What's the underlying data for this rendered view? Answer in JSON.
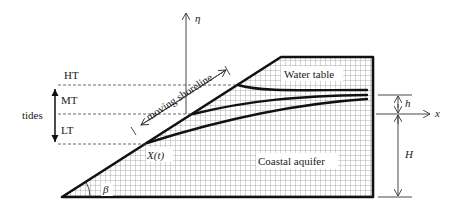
{
  "diagram": {
    "labels": {
      "eta_axis": "η",
      "x_axis": "x",
      "high_tide": "HT",
      "mean_tide": "MT",
      "low_tide": "LT",
      "tides": "tides",
      "moving_shoreline": "moving shoreline",
      "water_table": "Water table",
      "coastal_aquifer": "Coastal aquifer",
      "shoreline_position": "X(t)",
      "beach_slope_angle": "β",
      "tide_amplitude": "h",
      "aquifer_depth": "H"
    },
    "colors": {
      "outline": "#111111",
      "grid": "#9a9a9a",
      "background": "#ffffff"
    },
    "elements": {
      "aquifer_domain": "hatched grid region bounded by sloping beach face, top surface and vertical landward boundary",
      "water_table_curves": 3,
      "tide_levels": [
        "HT",
        "MT",
        "LT"
      ]
    }
  }
}
